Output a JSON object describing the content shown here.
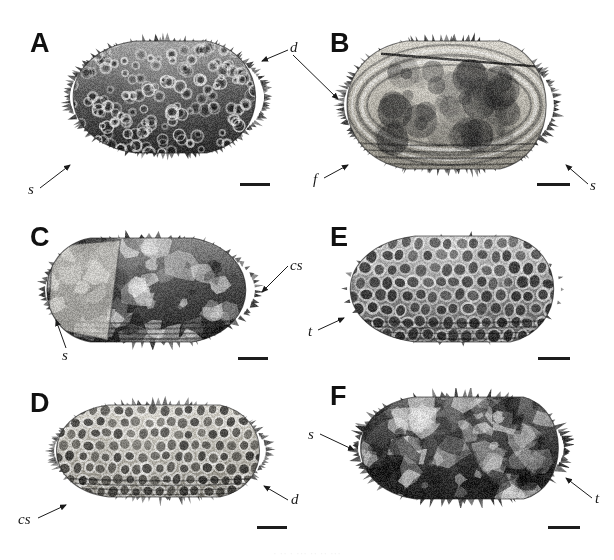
{
  "figure": {
    "type": "micrograph-plate",
    "background_color": "#ffffff",
    "width": 614,
    "height": 560,
    "panel_count": 6,
    "caption_remnant": "· ·· · ··· ·· ·· ···"
  },
  "panels": [
    {
      "letter": "A",
      "view": "dorsal-lateral carapace, densely spinose and reticulate",
      "tone": "dark",
      "annotations": [
        {
          "label": "d",
          "target": "dorsal spine row"
        },
        {
          "label": "s",
          "target": "ventral spine"
        }
      ],
      "scalebar": {
        "label": ""
      }
    },
    {
      "letter": "B",
      "view": "internal valve view with marginal spines",
      "tone": "light",
      "annotations": [
        {
          "label": "d",
          "target": "dorsal margin"
        },
        {
          "label": "f",
          "target": "frontal spine"
        },
        {
          "label": "s",
          "target": "posteroventral spine"
        }
      ],
      "scalebar": {
        "label": ""
      }
    },
    {
      "letter": "C",
      "view": "lateral valve, broken anterior region",
      "tone": "dark",
      "annotations": [
        {
          "label": "cs",
          "target": "caudal spine row"
        },
        {
          "label": "s",
          "target": "anteroventral spine"
        }
      ],
      "scalebar": {
        "label": ""
      }
    },
    {
      "letter": "D",
      "view": "lateral valve with coarse reticulation",
      "tone": "light",
      "annotations": [
        {
          "label": "cs",
          "target": "caudal spine"
        },
        {
          "label": "d",
          "target": "dorsal spine row"
        }
      ],
      "scalebar": {
        "label": ""
      }
    },
    {
      "letter": "E",
      "view": "lateral valve, strongly reticulate smooth margin",
      "tone": "medium",
      "annotations": [
        {
          "label": "t",
          "target": "anterior tubercle"
        }
      ],
      "scalebar": {
        "label": ""
      }
    },
    {
      "letter": "F",
      "view": "lateral valve, spinose with eroded surface",
      "tone": "dark",
      "annotations": [
        {
          "label": "s",
          "target": "anterior spine"
        },
        {
          "label": "t",
          "target": "posterior tubercle"
        }
      ],
      "scalebar": {
        "label": ""
      }
    }
  ],
  "legend_symbols": [
    {
      "symbol": "d",
      "meaning": "dorsal spines"
    },
    {
      "symbol": "s",
      "meaning": "spine"
    },
    {
      "symbol": "f",
      "meaning": "frontal spine"
    },
    {
      "symbol": "cs",
      "meaning": "caudal spine"
    },
    {
      "symbol": "t",
      "meaning": "tubercle"
    }
  ]
}
